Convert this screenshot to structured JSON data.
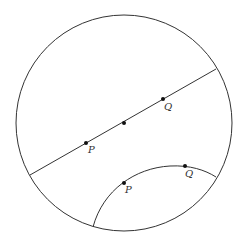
{
  "diagram": {
    "colors": {
      "stroke": "#333333",
      "background": "#ffffff"
    },
    "disk": {
      "cx": 124,
      "cy": 123,
      "r": 108
    },
    "diameter_geodesic": {
      "x1": 30,
      "y1": 175,
      "x2": 216,
      "y2": 69,
      "points": [
        {
          "name": "P",
          "label": "P",
          "x": 86,
          "y": 143,
          "lx": 88,
          "ly": 153
        },
        {
          "name": "center",
          "label": "",
          "x": 124,
          "y": 123
        },
        {
          "name": "Q",
          "label": "Q",
          "x": 163,
          "y": 99,
          "lx": 164,
          "ly": 110
        }
      ]
    },
    "arc_geodesic": {
      "path": "M 93 227 C 103 190, 135 168, 170 166 C 190 165, 205 170, 216 177",
      "points": [
        {
          "name": "P",
          "label": "P",
          "x": 124,
          "y": 183,
          "lx": 125,
          "ly": 193
        },
        {
          "name": "Q",
          "label": "Q",
          "x": 185,
          "y": 166,
          "lx": 185,
          "ly": 177
        }
      ]
    }
  }
}
